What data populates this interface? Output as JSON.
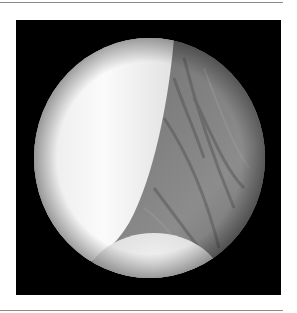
{
  "figure": {
    "type": "arthroscopic-view",
    "colors": {
      "frame": "#000000",
      "bright_structure": "#f4f4f4",
      "soft_tissue": "#7a7a7a",
      "rule": "#8a8a8a"
    }
  }
}
